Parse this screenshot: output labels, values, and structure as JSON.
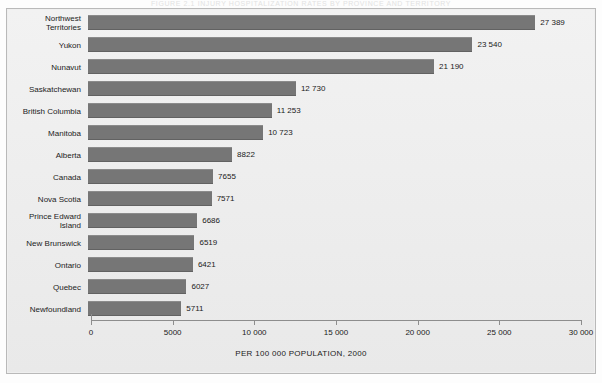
{
  "figure": {
    "cropped_title": "FIGURE 2.1   INJURY HOSPITALIZATION RATES BY PROVINCE AND TERRITORY",
    "axis_title": "PER 100 000 POPULATION, 2000",
    "bar_color": "#767676",
    "background_color": "#efefef"
  },
  "chart_data": {
    "type": "bar",
    "orientation": "horizontal",
    "title": "",
    "xlabel": "PER 100 000 POPULATION, 2000",
    "ylabel": "",
    "xlim": [
      0,
      30000
    ],
    "grid": false,
    "legend": null,
    "xticks": [
      0,
      5000,
      10000,
      15000,
      20000,
      25000,
      30000
    ],
    "xtick_labels": [
      "0",
      "5000",
      "10 000",
      "15 000",
      "20 000",
      "25 000",
      "30 000"
    ],
    "categories": [
      "Northwest\nTerritories",
      "Yukon",
      "Nunavut",
      "Saskatchewan",
      "British Columbia",
      "Manitoba",
      "Alberta",
      "Canada",
      "Nova Scotia",
      "Prince Edward\nIsland",
      "New Brunswick",
      "Ontario",
      "Quebec",
      "Newfoundland"
    ],
    "values": [
      27389,
      23540,
      21190,
      12730,
      11253,
      10723,
      8822,
      7655,
      7571,
      6686,
      6519,
      6421,
      6027,
      5711
    ],
    "value_labels": [
      "27 389",
      "23 540",
      "21 190",
      "12 730",
      "11 253",
      "10 723",
      "8822",
      "7655",
      "7571",
      "6686",
      "6519",
      "6421",
      "6027",
      "5711"
    ]
  }
}
